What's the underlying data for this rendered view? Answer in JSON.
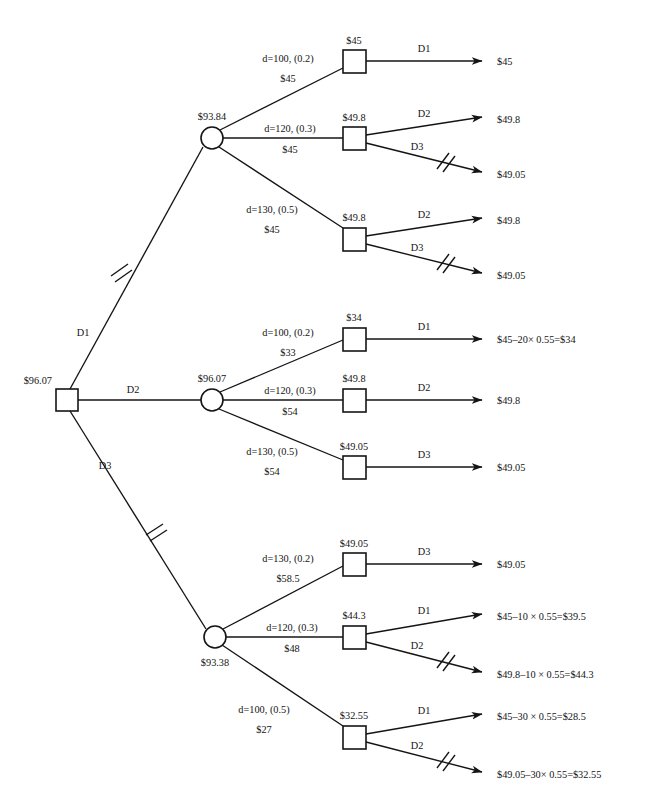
{
  "diagram": {
    "type": "decision-tree",
    "root": {
      "node_kind": "decision-square",
      "value": "$96.07"
    },
    "branch_letters": {
      "d1": "D1",
      "d2": "D2",
      "d3": "D3"
    },
    "chance_nodes": [
      {
        "id": "chance-top",
        "value": "$93.84"
      },
      {
        "id": "chance-middle",
        "value": "$96.07"
      },
      {
        "id": "chance-bottom",
        "value": "$93.38"
      }
    ],
    "root_branches": [
      {
        "label": "D1",
        "pruned": true,
        "to": "chance-top"
      },
      {
        "label": "D2",
        "pruned": false,
        "to": "chance-middle"
      },
      {
        "label": "D3",
        "pruned": true,
        "to": "chance-bottom"
      }
    ],
    "groups": [
      {
        "id": "group-top",
        "chance_value": "$93.84",
        "branches": [
          {
            "demand": "d=100, (0.2)",
            "cost": "$45",
            "node_value": "$45",
            "terminals": [
              {
                "label": "D1",
                "payoff": "$45",
                "pruned": false
              }
            ]
          },
          {
            "demand": "d=120, (0.3)",
            "cost": "$45",
            "node_value": "$49.8",
            "terminals": [
              {
                "label": "D2",
                "payoff": "$49.8",
                "pruned": false
              },
              {
                "label": "D3",
                "payoff": "$49.05",
                "pruned": true
              }
            ]
          },
          {
            "demand": "d=130, (0.5)",
            "cost": "$45",
            "node_value": "$49.8",
            "terminals": [
              {
                "label": "D2",
                "payoff": "$49.8",
                "pruned": false
              },
              {
                "label": "D3",
                "payoff": "$49.05",
                "pruned": true
              }
            ]
          }
        ]
      },
      {
        "id": "group-middle",
        "chance_value": "$96.07",
        "branches": [
          {
            "demand": "d=100, (0.2)",
            "cost": "$33",
            "node_value": "$34",
            "terminals": [
              {
                "label": "D1",
                "payoff": "$45–20× 0.55=$34",
                "pruned": false
              }
            ]
          },
          {
            "demand": "d=120, (0.3)",
            "cost": "$54",
            "node_value": "$49.8",
            "terminals": [
              {
                "label": "D2",
                "payoff": "$49.8",
                "pruned": false
              }
            ]
          },
          {
            "demand": "d=130, (0.5)",
            "cost": "$54",
            "node_value": "$49.05",
            "terminals": [
              {
                "label": "D3",
                "payoff": "$49.05",
                "pruned": false
              }
            ]
          }
        ]
      },
      {
        "id": "group-bottom",
        "chance_value": "$93.38",
        "branches": [
          {
            "demand": "d=130, (0.2)",
            "cost": "$58.5",
            "node_value": "$49.05",
            "terminals": [
              {
                "label": "D3",
                "payoff": "$49.05",
                "pruned": false
              }
            ]
          },
          {
            "demand": "d=120, (0.3)",
            "cost": "$48",
            "node_value": "$44.3",
            "terminals": [
              {
                "label": "D1",
                "payoff": "$45–10 × 0.55=$39.5",
                "pruned": false
              },
              {
                "label": "D2",
                "payoff": "$49.8–10 × 0.55=$44.3",
                "pruned": true
              }
            ]
          },
          {
            "demand": "d=100, (0.5)",
            "cost": "$27",
            "node_value": "$32.55",
            "terminals": [
              {
                "label": "D1",
                "payoff": "$45–30 × 0.55=$28.5",
                "pruned": false
              },
              {
                "label": "D2",
                "payoff": "$49.05–30× 0.55=$32.55",
                "pruned": true
              }
            ]
          }
        ]
      }
    ],
    "colors": {
      "ink": "#141414",
      "background": "#ffffff"
    }
  }
}
